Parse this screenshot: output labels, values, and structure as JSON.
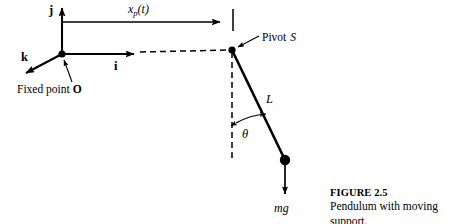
{
  "figure": {
    "caption_title": "FIGURE 2.5",
    "caption_text": "Pendulum with moving support.",
    "background_color": "#ffffff",
    "ink_color": "#000000"
  },
  "labels": {
    "unit_vector_j": "j",
    "unit_vector_i": "i",
    "unit_vector_k": "k",
    "support_displacement_base": "x",
    "support_displacement_sub": "p",
    "support_displacement_arg": "(t)",
    "fixed_point_text": "Fixed point",
    "fixed_point_name": "O",
    "pivot_text": "Pivot",
    "pivot_name": "S",
    "rod_length": "L",
    "angle": "θ",
    "weight_force": "mg"
  },
  "geometry": {
    "origin_x": 62,
    "origin_y": 54,
    "pivot_x": 232,
    "pivot_y": 50,
    "bob_x": 285,
    "bob_y": 160,
    "weight_arrow_tip_y": 198,
    "j_arrow_tip_y": 6,
    "i_arrow_tip_x": 140,
    "k_arrow_tip_x": 22,
    "k_arrow_tip_y": 76,
    "xp_arrow_start_x": 62,
    "xp_arrow_start_y": 22,
    "xp_arrow_tip_x": 226,
    "tick_mark_x": 233,
    "tick_mark_top_y": 9,
    "tick_mark_bottom_y": 31,
    "dashed_horizontal_end_x": 232,
    "dashed_vertical_end_y": 162,
    "theta_arc_radius": 70
  }
}
